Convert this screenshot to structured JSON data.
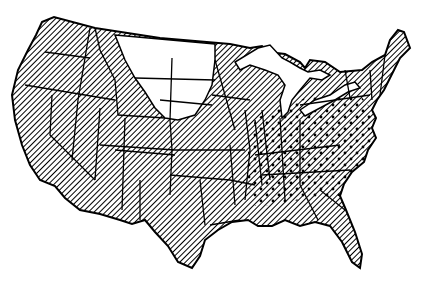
{
  "map": {
    "subject": "Contiguous United States",
    "style": "black-and-white line map",
    "colors": {
      "outline": "#000000",
      "background": "#ffffff",
      "hatch": "#000000"
    },
    "legend_categories": [
      {
        "pattern": "diagonal-hatch",
        "meaning_visible": "hatched region (most states)"
      },
      {
        "pattern": "hatch-with-dots",
        "meaning_visible": "hatched and dotted region (eastern/southeastern states)"
      },
      {
        "pattern": "blank",
        "meaning_visible": "unshaded region (northern plains)"
      }
    ],
    "regions": {
      "blank": [
        "Montana (east)",
        "North Dakota",
        "South Dakota (north)",
        "Wyoming (north-east)"
      ],
      "dotted": [
        "Michigan (south)",
        "Indiana",
        "Ohio",
        "Kentucky",
        "Tennessee",
        "West Virginia",
        "Virginia",
        "North Carolina",
        "South Carolina",
        "Georgia",
        "Alabama",
        "Mississippi (north)",
        "Pennsylvania (south)",
        "Illinois (south)",
        "Missouri (east)",
        "Arkansas (east)"
      ],
      "hatched_only": [
        "Washington",
        "Oregon",
        "California",
        "Nevada",
        "Idaho",
        "Utah",
        "Arizona",
        "New Mexico",
        "Colorado",
        "Texas",
        "Oklahoma",
        "Kansas",
        "Nebraska",
        "Minnesota",
        "Iowa",
        "Wisconsin",
        "Louisiana",
        "Florida",
        "New York",
        "New England"
      ]
    }
  }
}
